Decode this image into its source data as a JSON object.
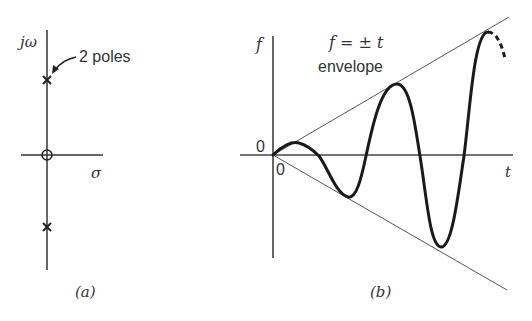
{
  "figure": {
    "panel_a": {
      "caption": "(a)",
      "y_axis_label": "jω",
      "x_axis_label": "σ",
      "annotation": "2 poles",
      "markers": {
        "origin": "zero-circle",
        "upper_pole": "x",
        "lower_pole": "x"
      }
    },
    "panel_b": {
      "caption": "(b)",
      "y_axis_label": "f",
      "x_axis_label": "t",
      "origin_label_y": "0",
      "origin_label_x": "0",
      "envelope_equation": "f = ± t",
      "envelope_label": "envelope"
    }
  },
  "colors": {
    "ink": "#222222",
    "thin_line": "#555555",
    "background": "#ffffff"
  }
}
